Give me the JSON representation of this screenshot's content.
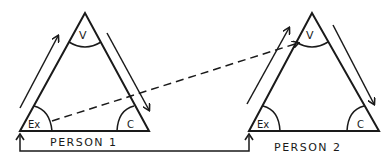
{
  "diagram": {
    "person1": {
      "label": "PERSON 1",
      "angles": {
        "top": "V",
        "left": "Ex",
        "right": "C"
      }
    },
    "person2": {
      "label": "PERSON 2",
      "angles": {
        "top": "V",
        "left": "Ex",
        "right": "C"
      }
    },
    "connections": [
      {
        "from": "person1.Ex",
        "to": "person2.V",
        "style": "dashed-arrow"
      },
      {
        "from": "person1.base",
        "to": "person2.Ex",
        "style": "solid-bracket-arrow"
      }
    ],
    "colors": {
      "ink": "#1a1a1a",
      "background": "#ffffff"
    }
  }
}
